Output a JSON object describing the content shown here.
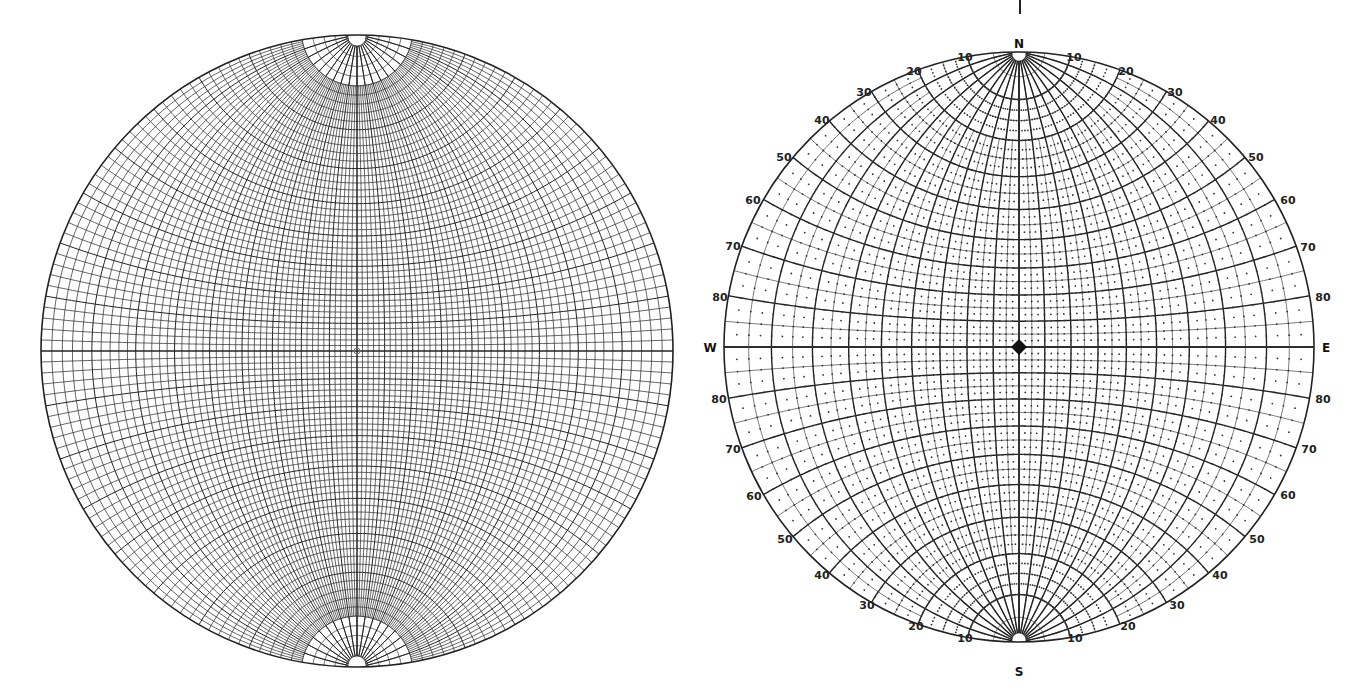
{
  "figure": {
    "left_net": {
      "type": "equatorial stereographic net (polar caps at N and S)",
      "center_mark": "small circle"
    },
    "right_net": {
      "type": "equatorial stereographic net with dotted grid",
      "center_mark": "diamond",
      "cardinals": {
        "north": "N",
        "south": "S",
        "east": "E",
        "west": "W"
      },
      "top_left_labels": [
        "10",
        "20",
        "30",
        "40",
        "50",
        "60",
        "70",
        "80"
      ],
      "top_right_labels": [
        "10",
        "20",
        "30",
        "40",
        "50",
        "60",
        "70",
        "80"
      ],
      "bottom_left_labels": [
        "10",
        "20",
        "30",
        "40",
        "50",
        "60",
        "70",
        "80"
      ],
      "bottom_right_labels": [
        "10",
        "20",
        "30",
        "40",
        "50",
        "60",
        "70",
        "80"
      ]
    },
    "top_tick": "|"
  },
  "colors": {
    "line": "#222222",
    "background": "#ffffff",
    "dot": "#333333"
  }
}
